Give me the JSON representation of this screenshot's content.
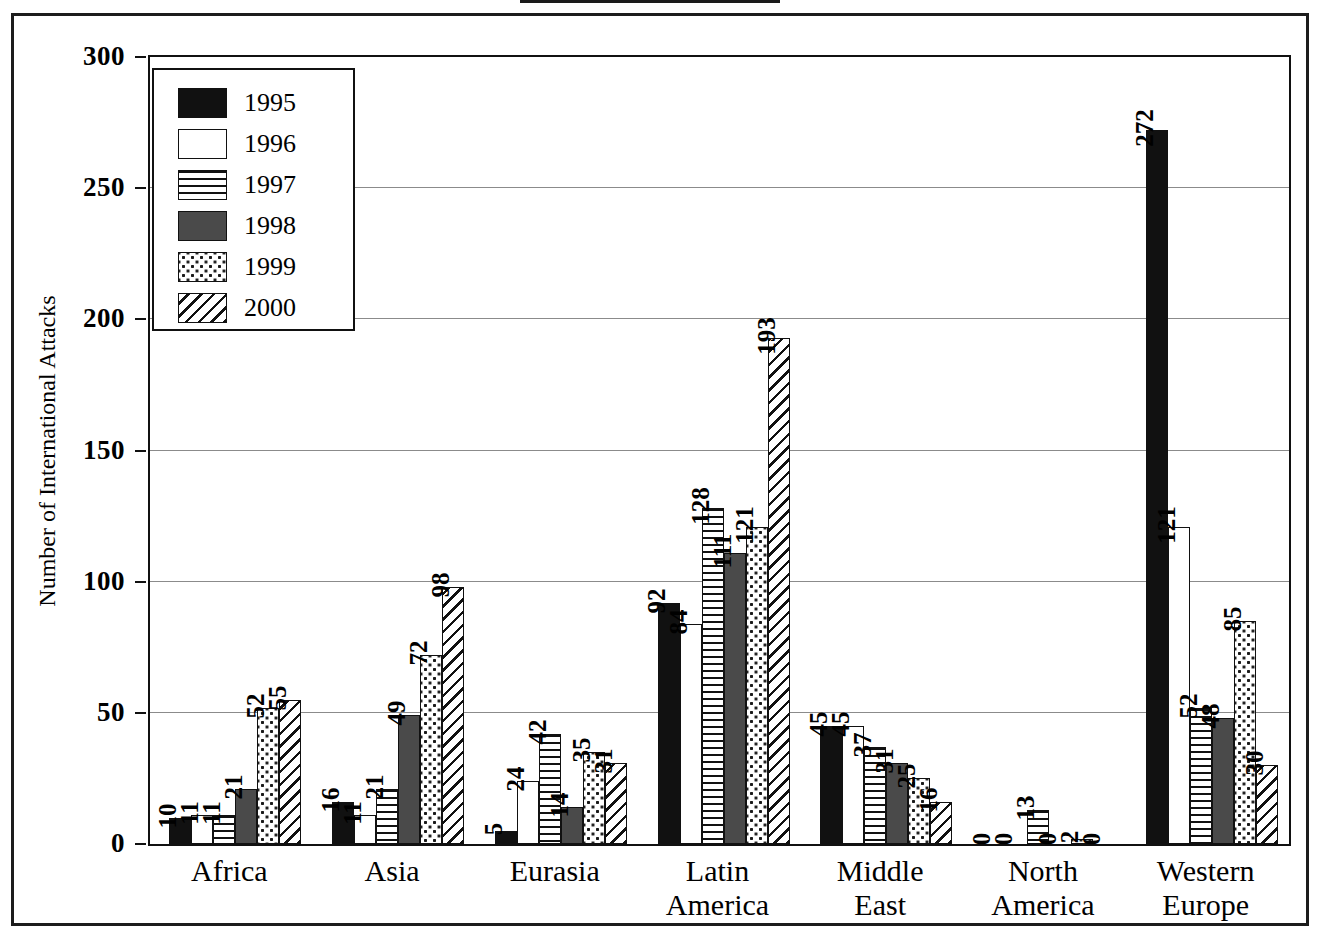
{
  "chart_data": {
    "type": "bar",
    "title": "",
    "xlabel": "",
    "ylabel": "Number of International Attacks",
    "ylim": [
      0,
      300
    ],
    "yticks": [
      "0",
      "50",
      "100",
      "150",
      "200",
      "250",
      "300"
    ],
    "grid": true,
    "legend_position": "top-left",
    "categories": [
      "Africa",
      "Asia",
      "Eurasia",
      "Latin\nAmerica",
      "Middle\nEast",
      "North\nAmerica",
      "Western\nEurope"
    ],
    "series": [
      {
        "name": "1995",
        "fill": "solid-black",
        "values": [
          10,
          16,
          5,
          92,
          45,
          0,
          272
        ]
      },
      {
        "name": "1996",
        "fill": "white",
        "values": [
          11,
          11,
          24,
          84,
          45,
          0,
          121
        ]
      },
      {
        "name": "1997",
        "fill": "horizontal-lines",
        "values": [
          11,
          21,
          42,
          128,
          37,
          13,
          52
        ]
      },
      {
        "name": "1998",
        "fill": "dark-gray",
        "values": [
          21,
          49,
          14,
          111,
          31,
          0,
          48
        ]
      },
      {
        "name": "1999",
        "fill": "dotted",
        "values": [
          52,
          72,
          35,
          121,
          25,
          2,
          85
        ]
      },
      {
        "name": "2000",
        "fill": "diagonal-hatch",
        "values": [
          55,
          98,
          31,
          193,
          16,
          0,
          30
        ]
      }
    ]
  },
  "legend": {
    "items": [
      {
        "label": "1995",
        "fill": "solid-black"
      },
      {
        "label": "1996",
        "fill": "white"
      },
      {
        "label": "1997",
        "fill": "horizontal-lines"
      },
      {
        "label": "1998",
        "fill": "dark-gray"
      },
      {
        "label": "1999",
        "fill": "dotted"
      },
      {
        "label": "2000",
        "fill": "diagonal-hatch"
      }
    ]
  },
  "colors": {
    "axis": "#111111",
    "grid": "#8b8b8b",
    "series_1995": "#111111",
    "series_1996": "#ffffff",
    "series_1998": "#4a4a4a",
    "background": "#ffffff"
  }
}
